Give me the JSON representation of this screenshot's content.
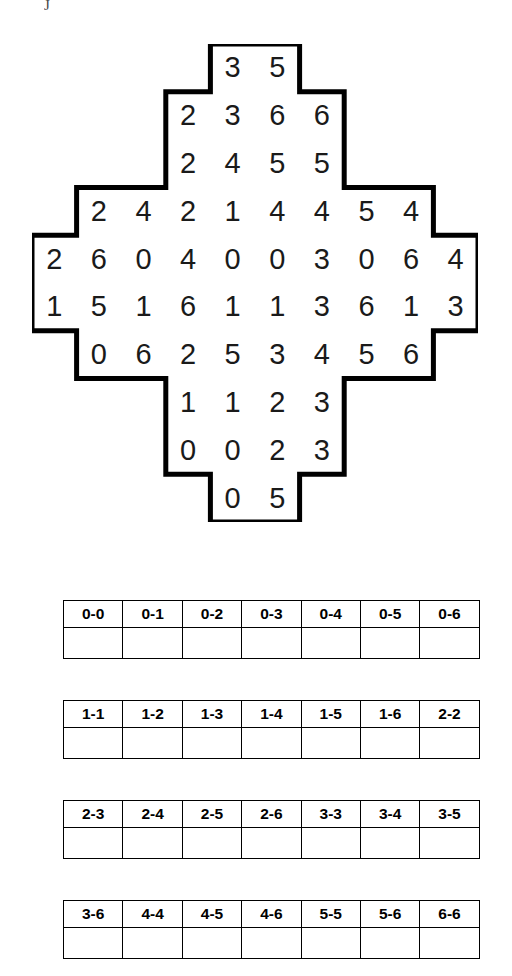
{
  "artifact": {
    "glyph": "J"
  },
  "puzzle": {
    "title": "Domino grid puzzle",
    "shape": "cross-diamond",
    "columns": 10,
    "rows": 10,
    "cell_width": 44.6,
    "cell_height": 47.8,
    "outline_color": "#000000",
    "digit_color": "#1a1a1a",
    "grid_rows": [
      {
        "row": 0,
        "start_col": 4,
        "values": [
          3,
          5
        ]
      },
      {
        "row": 1,
        "start_col": 3,
        "values": [
          2,
          3,
          6,
          6
        ]
      },
      {
        "row": 2,
        "start_col": 3,
        "values": [
          2,
          4,
          5,
          5
        ]
      },
      {
        "row": 3,
        "start_col": 1,
        "values": [
          2,
          4,
          2,
          1,
          4,
          4,
          5,
          4
        ]
      },
      {
        "row": 4,
        "start_col": 0,
        "values": [
          2,
          6,
          0,
          4,
          0,
          0,
          3,
          0,
          6,
          4
        ]
      },
      {
        "row": 5,
        "start_col": 0,
        "values": [
          1,
          5,
          1,
          6,
          1,
          1,
          3,
          6,
          1,
          3
        ]
      },
      {
        "row": 6,
        "start_col": 1,
        "values": [
          0,
          6,
          2,
          5,
          3,
          4,
          5,
          6
        ]
      },
      {
        "row": 7,
        "start_col": 3,
        "values": [
          1,
          1,
          2,
          3
        ]
      },
      {
        "row": 8,
        "start_col": 3,
        "values": [
          0,
          0,
          2,
          3
        ]
      },
      {
        "row": 9,
        "start_col": 4,
        "values": [
          0,
          5
        ]
      }
    ]
  },
  "domino_tables": [
    {
      "top": 600,
      "labels": [
        "0-0",
        "0-1",
        "0-2",
        "0-3",
        "0-4",
        "0-5",
        "0-6"
      ],
      "checks": [
        "",
        "",
        "",
        "",
        "",
        "",
        ""
      ]
    },
    {
      "top": 700,
      "labels": [
        "1-1",
        "1-2",
        "1-3",
        "1-4",
        "1-5",
        "1-6",
        "2-2"
      ],
      "checks": [
        "",
        "",
        "",
        "",
        "",
        "",
        ""
      ]
    },
    {
      "top": 800,
      "labels": [
        "2-3",
        "2-4",
        "2-5",
        "2-6",
        "3-3",
        "3-4",
        "3-5"
      ],
      "checks": [
        "",
        "",
        "",
        "",
        "",
        "",
        ""
      ]
    },
    {
      "top": 900,
      "labels": [
        "3-6",
        "4-4",
        "4-5",
        "4-6",
        "5-5",
        "5-6",
        "6-6"
      ],
      "checks": [
        "",
        "",
        "",
        "",
        "",
        "",
        ""
      ]
    }
  ]
}
